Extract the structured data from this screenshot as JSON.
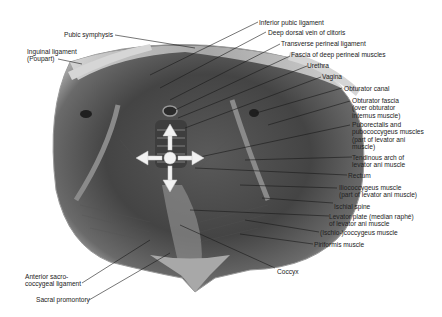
{
  "figure": {
    "labels": {
      "pubic_symphysis": "Pubic symphysis",
      "inguinal_ligament": "Inguinal ligament\n(Poupart)",
      "inferior_pubic_ligament": "Inferior pubic ligament",
      "deep_dorsal_vein": "Deep dorsal vein of clitoris",
      "transverse_perineal_ligament": "Transverse perineal ligament",
      "fascia_deep_perineal": "Fascia of deep perineal muscles",
      "urethra": "Urethra",
      "vagina": "Vagina",
      "obturator_canal": "Obturator canal",
      "obturator_fascia": "Obturator fascia\n(over obturator\ninternus muscle)",
      "puborectalis": "Puborectalis and\npubococcygeus muscles\n(part of levator ani\nmuscle)",
      "tendinous_arch": "Tendinous arch of\nlevator ani muscle",
      "rectum": "Rectum",
      "iliococcygeus": "Iliococcygeus muscle\n(part of levator ani muscle)",
      "ischial_spine": "Ischial spine",
      "levator_plate": "Levator plate (median raphé)\nof levator ani muscle",
      "ischiococcygeus": "(Ischio-)coccygeus muscle",
      "piriformis": "Piriformis muscle",
      "coccyx": "Coccyx",
      "anterior_sacrococcygeal": "Anterior sacro-\ncoccygeal ligament",
      "sacral_promontory": "Sacral promontory"
    },
    "arrows": {
      "center": "circle",
      "directions": [
        "up",
        "down",
        "left",
        "right"
      ],
      "color": "#f2f2f2"
    },
    "colors": {
      "background": "#ffffff",
      "muscle_dark": "#3a3a3a",
      "muscle_mid": "#6b6b6b",
      "bone_light": "#c9c9c9",
      "leader_line": "#1a1a1a"
    }
  }
}
